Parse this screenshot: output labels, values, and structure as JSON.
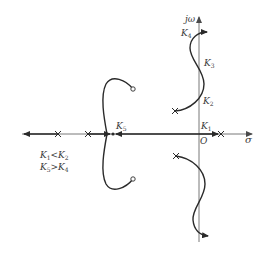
{
  "diagram": {
    "type": "root-locus",
    "axes": {
      "real_axis_label": "σ",
      "imag_axis_label": "jω",
      "origin_label": "O"
    },
    "gain_labels": {
      "k1": "K",
      "k1_sub": "1",
      "k2": "K",
      "k2_sub": "2",
      "k3": "K",
      "k3_sub": "3",
      "k4": "K",
      "k4_sub": "4",
      "k5": "K",
      "k5_sub": "5"
    },
    "conditions": [
      {
        "left": "K",
        "left_sub": "1",
        "op": "<",
        "right": "K",
        "right_sub": "2"
      },
      {
        "left": "K",
        "left_sub": "5",
        "op": ">",
        "right": "K",
        "right_sub": "4"
      }
    ],
    "poles": [
      {
        "name": "pole-real-right",
        "x": 221,
        "y": 134
      },
      {
        "name": "pole-real-left-1",
        "x": 58,
        "y": 134
      },
      {
        "name": "pole-real-left-2",
        "x": 88,
        "y": 134
      },
      {
        "name": "pole-complex-upper",
        "x": 175,
        "y": 111
      },
      {
        "name": "pole-complex-lower",
        "x": 176,
        "y": 156
      }
    ],
    "zeros": [
      {
        "name": "zero-complex-upper",
        "x": 133,
        "y": 89
      },
      {
        "name": "zero-complex-lower",
        "x": 133,
        "y": 179
      }
    ],
    "breakaway_point_label": "K5",
    "colors": {
      "locus": "#2a2a2a",
      "axis": "#6a6a6a",
      "text": "#3a3a3a",
      "background": "#ffffff"
    }
  }
}
